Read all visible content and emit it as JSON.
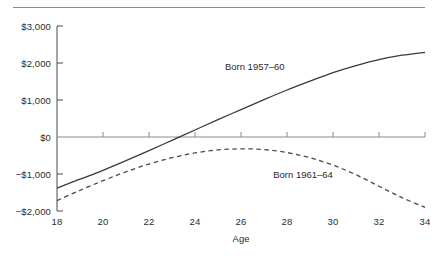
{
  "chart_data": {
    "type": "line",
    "title": "",
    "xlabel": "Age",
    "ylabel": "",
    "xlim": [
      18,
      34
    ],
    "ylim": [
      -2000,
      3000
    ],
    "grid": false,
    "legend_position": "inline-annotation",
    "x_ticks": [
      18,
      20,
      22,
      24,
      26,
      28,
      30,
      32,
      34
    ],
    "x_tick_labels": [
      "18",
      "20",
      "22",
      "24",
      "26",
      "28",
      "30",
      "32",
      "34"
    ],
    "y_ticks": [
      -2000,
      -1000,
      0,
      1000,
      2000,
      3000
    ],
    "y_tick_labels": [
      "−$2,000",
      "−$1,000",
      "$0",
      "$1,000",
      "$2,000",
      "$3,000"
    ],
    "zero_line": 0,
    "series": [
      {
        "name": "Born 1957–60",
        "style": "solid",
        "color": "#3a3a3a",
        "annotation": "Born 1957–60",
        "x": [
          18,
          19,
          20,
          21,
          22,
          23,
          24,
          25,
          26,
          27,
          28,
          29,
          30,
          31,
          32,
          33,
          34
        ],
        "values": [
          -1380,
          -1140,
          -900,
          -640,
          -370,
          -90,
          190,
          470,
          740,
          1010,
          1270,
          1510,
          1740,
          1930,
          2090,
          2210,
          2290
        ]
      },
      {
        "name": "Born 1961–64",
        "style": "dashed",
        "color": "#4a4a4a",
        "annotation": "Born 1961–64",
        "x": [
          18,
          19,
          20,
          21,
          22,
          23,
          24,
          25,
          26,
          27,
          28,
          29,
          30,
          31,
          32,
          33,
          34
        ],
        "values": [
          -1720,
          -1440,
          -1180,
          -940,
          -730,
          -560,
          -430,
          -350,
          -320,
          -340,
          -420,
          -560,
          -760,
          -1020,
          -1330,
          -1640,
          -1900
        ]
      }
    ],
    "annotations": [
      {
        "text": "Born 1957–60",
        "x": 25.3,
        "y": 1900
      },
      {
        "text": "Born 1961–64",
        "x": 27.4,
        "y": -1030
      }
    ]
  }
}
